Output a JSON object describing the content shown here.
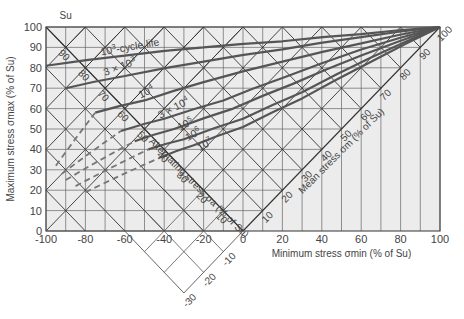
{
  "chart_data": {
    "type": "line",
    "title": "",
    "xlabel": "Minimum stress σmin (% of Su)",
    "ylabel": "Maximum stress σmax (% of Su)",
    "xlim": [
      -100,
      100
    ],
    "ylim": [
      0,
      100
    ],
    "x_ticks": [
      "-100",
      "-80",
      "-60",
      "-40",
      "-20",
      "0",
      "20",
      "40",
      "60",
      "80",
      "100"
    ],
    "y_ticks": [
      "0",
      "10",
      "20",
      "30",
      "40",
      "50",
      "60",
      "70",
      "80",
      "90",
      "100"
    ],
    "grid": true,
    "top_marker": "Su",
    "alternating_axis": {
      "label": "Alternating stress σa (% of Su)",
      "ticks": [
        "10",
        "20",
        "30",
        "40",
        "50",
        "60",
        "70",
        "80",
        "90"
      ]
    },
    "mean_axis": {
      "label": "Mean stress σm (% of Su)",
      "ticks": [
        "10",
        "20",
        "30",
        "40",
        "50",
        "60",
        "70",
        "80",
        "90",
        "100"
      ],
      "negative_ticks": [
        "-10",
        "-20",
        "-30"
      ]
    },
    "series": [
      {
        "name": "10³-cycle life",
        "label_main": "10",
        "label_exp": "3",
        "label_suffix": "-cycle life",
        "points": [
          [
            -100,
            81
          ],
          [
            -60,
            86
          ],
          [
            -20,
            90
          ],
          [
            20,
            93
          ],
          [
            60,
            96.5
          ],
          [
            100,
            100
          ]
        ]
      },
      {
        "name": "3 × 10³",
        "label_main": "3 × 10",
        "label_exp": "3",
        "label_suffix": "",
        "points": [
          [
            -90,
            70
          ],
          [
            -60,
            76
          ],
          [
            -20,
            83
          ],
          [
            20,
            89
          ],
          [
            60,
            95
          ],
          [
            100,
            100
          ]
        ]
      },
      {
        "name": "10⁴",
        "label_main": "10",
        "label_exp": "4",
        "label_suffix": "",
        "points": [
          [
            -75,
            58
          ],
          [
            -50,
            64
          ],
          [
            -20,
            73
          ],
          [
            20,
            83
          ],
          [
            60,
            92
          ],
          [
            100,
            100
          ]
        ]
      },
      {
        "name": "3 × 10⁴",
        "label_main": "3 × 10",
        "label_exp": "4",
        "label_suffix": "",
        "points": [
          [
            -62,
            49
          ],
          [
            -40,
            55
          ],
          [
            -10,
            64
          ],
          [
            20,
            75
          ],
          [
            60,
            89
          ],
          [
            100,
            100
          ]
        ]
      },
      {
        "name": "10⁵",
        "label_main": "10",
        "label_exp": "5",
        "label_suffix": "",
        "points": [
          [
            -55,
            44
          ],
          [
            -35,
            50
          ],
          [
            -5,
            60
          ],
          [
            25,
            72
          ],
          [
            60,
            86
          ],
          [
            100,
            100
          ]
        ]
      },
      {
        "name": "10⁶",
        "label_main": "10",
        "label_exp": "6",
        "label_suffix": "",
        "points": [
          [
            -48,
            40
          ],
          [
            -30,
            45
          ],
          [
            0,
            55
          ],
          [
            30,
            68
          ],
          [
            65,
            85
          ],
          [
            100,
            100
          ]
        ]
      },
      {
        "name": "10⁷",
        "label_main": "10",
        "label_exp": "7",
        "label_suffix": "",
        "points": [
          [
            -42,
            36
          ],
          [
            -25,
            42
          ],
          [
            0,
            51
          ],
          [
            30,
            65
          ],
          [
            65,
            83
          ],
          [
            100,
            100
          ]
        ]
      }
    ],
    "dashed_extensions": [
      {
        "name": "10⁴ ext",
        "points": [
          [
            -95,
            32
          ],
          [
            -75,
            58
          ]
        ]
      },
      {
        "name": "3 × 10⁴ ext",
        "points": [
          [
            -92,
            28
          ],
          [
            -62,
            49
          ]
        ]
      },
      {
        "name": "10⁵ ext",
        "points": [
          [
            -90,
            25
          ],
          [
            -55,
            44
          ]
        ]
      },
      {
        "name": "10⁶ ext",
        "points": [
          [
            -85,
            22
          ],
          [
            -48,
            40
          ]
        ]
      },
      {
        "name": "10⁷ ext",
        "points": [
          [
            -80,
            19
          ],
          [
            -42,
            36
          ]
        ]
      }
    ]
  }
}
